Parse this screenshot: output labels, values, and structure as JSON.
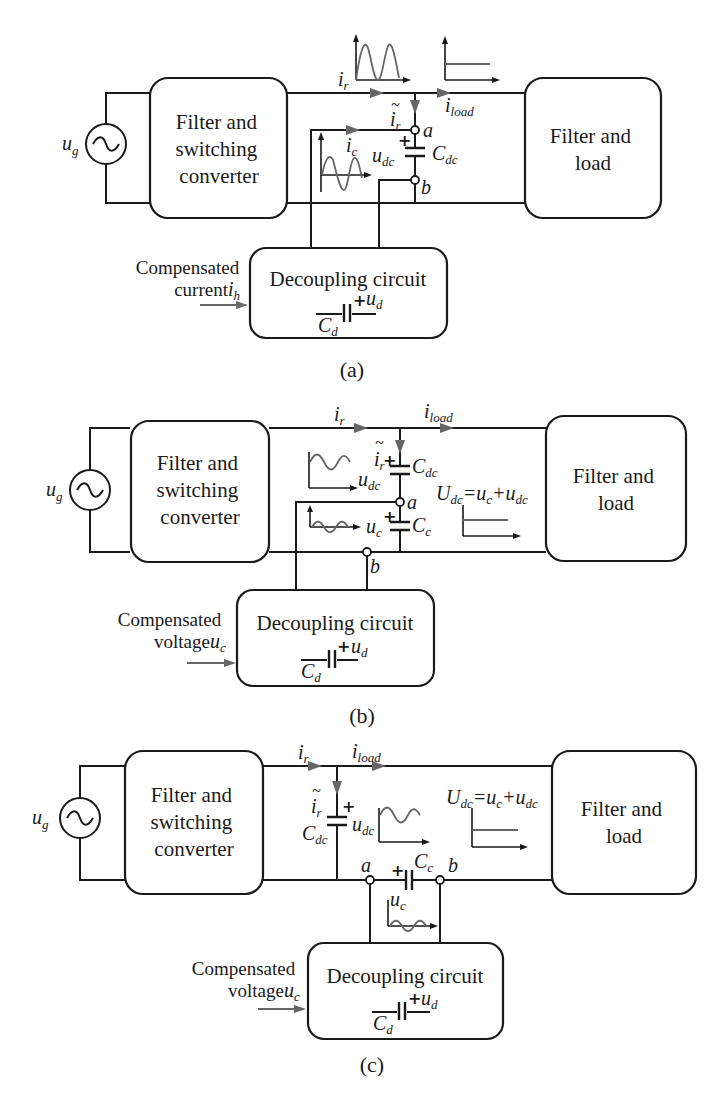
{
  "figure": {
    "panels": [
      {
        "caption": "(a)",
        "source_label": "u",
        "source_sub": "g",
        "left_box": [
          "Filter and",
          "switching",
          "converter"
        ],
        "right_box": [
          "Filter and",
          "load"
        ],
        "decoupling_box": "Decoupling circuit",
        "decoupling_cap": {
          "label": "C",
          "sub": "d",
          "volt": "u",
          "volt_sub": "d",
          "sign": "+"
        },
        "input_note": [
          "Compensated",
          "current "
        ],
        "input_symbol": {
          "label": "i",
          "sub": "h"
        },
        "labels": {
          "ir": {
            "label": "i",
            "sub": "r"
          },
          "iload": {
            "label": "i",
            "sub": "load"
          },
          "ir_tilde": {
            "label": "i",
            "sub": "r",
            "accent": "~"
          },
          "ic": {
            "label": "i",
            "sub": "c"
          },
          "udc": {
            "label": "u",
            "sub": "dc"
          },
          "cdc": {
            "label": "C",
            "sub": "dc"
          },
          "node_a": "a",
          "node_b": "b",
          "plus": "+"
        }
      },
      {
        "caption": "(b)",
        "source_label": "u",
        "source_sub": "g",
        "left_box": [
          "Filter and",
          "switching",
          "converter"
        ],
        "right_box": [
          "Filter and",
          "load"
        ],
        "decoupling_box": "Decoupling circuit",
        "decoupling_cap": {
          "label": "C",
          "sub": "d",
          "volt": "u",
          "volt_sub": "d",
          "sign": "+"
        },
        "input_note": [
          "Compensated",
          "voltage "
        ],
        "input_symbol": {
          "label": "u",
          "sub": "c"
        },
        "equation": {
          "lhs": "U",
          "lhs_sub": "dc",
          "rhs1": "=u",
          "rhs1_sub": "c",
          "rhs2": "+u",
          "rhs2_sub": "dc"
        },
        "labels": {
          "ir": {
            "label": "i",
            "sub": "r"
          },
          "iload": {
            "label": "i",
            "sub": "load"
          },
          "ir_tilde": {
            "label": "i",
            "sub": "r",
            "accent": "~"
          },
          "udc": {
            "label": "u",
            "sub": "dc"
          },
          "cdc": {
            "label": "C",
            "sub": "dc"
          },
          "uc": {
            "label": "u",
            "sub": "c"
          },
          "cc": {
            "label": "C",
            "sub": "c"
          },
          "node_a": "a",
          "node_b": "b",
          "plus": "+"
        }
      },
      {
        "caption": "(c)",
        "source_label": "u",
        "source_sub": "g",
        "left_box": [
          "Filter and",
          "switching",
          "converter"
        ],
        "right_box": [
          "Filter and",
          "load"
        ],
        "decoupling_box": "Decoupling circuit",
        "decoupling_cap": {
          "label": "C",
          "sub": "d",
          "volt": "u",
          "volt_sub": "d",
          "sign": "+"
        },
        "input_note": [
          "Compensated",
          "voltage "
        ],
        "input_symbol": {
          "label": "u",
          "sub": "c"
        },
        "equation": {
          "lhs": "U",
          "lhs_sub": "dc",
          "rhs1": "=u",
          "rhs1_sub": "c",
          "rhs2": "+u",
          "rhs2_sub": "dc"
        },
        "labels": {
          "ir": {
            "label": "i",
            "sub": "r"
          },
          "iload": {
            "label": "i",
            "sub": "load"
          },
          "ir_tilde": {
            "label": "i",
            "sub": "r",
            "accent": "~"
          },
          "udc": {
            "label": "u",
            "sub": "dc"
          },
          "cdc": {
            "label": "C",
            "sub": "dc"
          },
          "uc": {
            "label": "u",
            "sub": "c"
          },
          "cc": {
            "label": "C",
            "sub": "c"
          },
          "node_a": "a",
          "node_b": "b",
          "plus": "+"
        }
      }
    ],
    "colors": {
      "line": "#1a1a1a",
      "waveform": "#666666",
      "background": "#ffffff"
    }
  }
}
